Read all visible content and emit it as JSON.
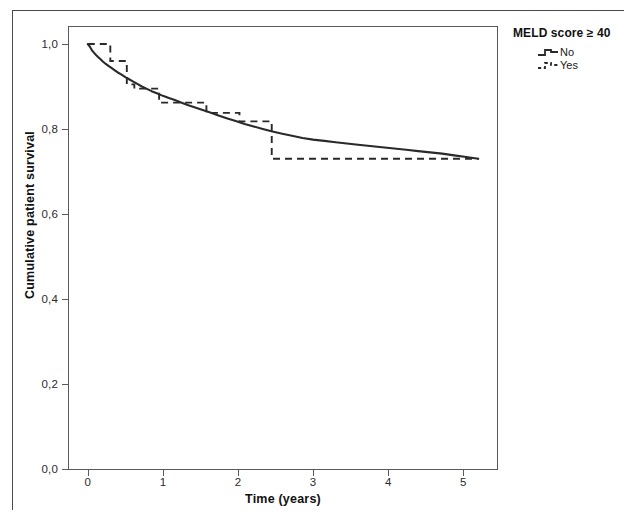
{
  "figure": {
    "legend": {
      "title": "MELD score ≥ 40",
      "entries": [
        {
          "label": "No",
          "style": "solid"
        },
        {
          "label": "Yes",
          "style": "dashed"
        }
      ]
    }
  },
  "chart_data": {
    "type": "line",
    "subtype": "kaplan-meier-survival",
    "title": "",
    "xlabel": "Time (years)",
    "ylabel": "Cumulative patient survival",
    "xlim": [
      -0.25,
      5.45
    ],
    "ylim": [
      0.0,
      1.04
    ],
    "xticks": [
      0,
      1,
      2,
      3,
      4,
      5
    ],
    "xtick_labels": [
      "0",
      "1",
      "2",
      "3",
      "4",
      "5"
    ],
    "yticks": [
      0.0,
      0.2,
      0.4,
      0.6,
      0.8,
      1.0
    ],
    "ytick_labels": [
      "0,0",
      "0,2",
      "0,4",
      "0,6",
      "0,8",
      "1,0"
    ],
    "grid": false,
    "legend_position": "upper-right-outside",
    "legend_title": "MELD score ≥ 40",
    "decimal_separator": ",",
    "line_color": "#2a2a2a",
    "series": [
      {
        "name": "No",
        "style": "solid",
        "x": [
          0.0,
          0.03,
          0.05,
          0.07,
          0.09,
          0.11,
          0.14,
          0.17,
          0.2,
          0.24,
          0.28,
          0.32,
          0.36,
          0.4,
          0.45,
          0.5,
          0.55,
          0.6,
          0.66,
          0.72,
          0.78,
          0.85,
          0.92,
          1.0,
          1.08,
          1.16,
          1.25,
          1.34,
          1.44,
          1.54,
          1.64,
          1.75,
          1.86,
          1.97,
          2.09,
          2.21,
          2.33,
          2.46,
          2.59,
          2.72,
          2.86,
          3.0,
          3.15,
          3.3,
          3.45,
          3.6,
          3.76,
          3.92,
          4.08,
          4.24,
          4.4,
          4.56,
          4.72,
          4.88,
          5.04,
          5.2
        ],
        "y": [
          1.0,
          0.993,
          0.987,
          0.982,
          0.978,
          0.974,
          0.969,
          0.964,
          0.959,
          0.953,
          0.948,
          0.943,
          0.938,
          0.933,
          0.928,
          0.922,
          0.917,
          0.912,
          0.906,
          0.9,
          0.895,
          0.889,
          0.884,
          0.878,
          0.873,
          0.868,
          0.862,
          0.856,
          0.85,
          0.844,
          0.838,
          0.831,
          0.825,
          0.819,
          0.812,
          0.806,
          0.8,
          0.794,
          0.789,
          0.784,
          0.779,
          0.775,
          0.772,
          0.769,
          0.766,
          0.763,
          0.76,
          0.757,
          0.754,
          0.751,
          0.748,
          0.745,
          0.742,
          0.738,
          0.734,
          0.73
        ]
      },
      {
        "name": "Yes",
        "style": "dashed",
        "step": "post",
        "x": [
          0.0,
          0.3,
          0.3,
          0.52,
          0.52,
          0.62,
          0.62,
          0.95,
          0.95,
          1.58,
          1.58,
          2.02,
          2.02,
          2.45,
          2.45,
          5.2
        ],
        "y": [
          1.0,
          1.0,
          0.96,
          0.96,
          0.905,
          0.905,
          0.895,
          0.895,
          0.862,
          0.862,
          0.838,
          0.838,
          0.818,
          0.818,
          0.73,
          0.73
        ]
      }
    ],
    "annotations": [
      "Both groups converge near 0,73 at 5 years",
      "Dashed (Yes) curve censored flat after ~2,5 years"
    ]
  }
}
